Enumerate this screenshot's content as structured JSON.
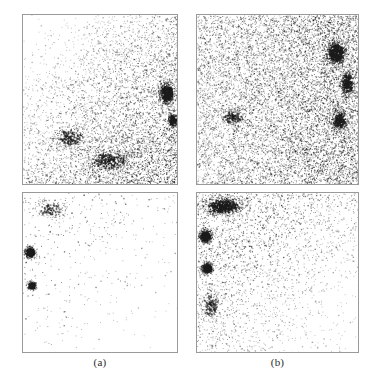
{
  "figure": {
    "background_color": "#ffffff",
    "border_color": "#9a9a9a",
    "point_color": "#1b1b1b",
    "width": 382,
    "height": 389
  },
  "captions": {
    "a": "(a)",
    "b": "(b)"
  },
  "chart_data": [
    {
      "id": "panel-a-top",
      "type": "scatter",
      "title": "",
      "xlabel": "",
      "ylabel": "",
      "xlim": [
        0,
        1
      ],
      "ylim": [
        0,
        1
      ],
      "grid": false,
      "legend": null,
      "n_points": 5200,
      "point_color": "#1b1b1b",
      "point_size_px": 1,
      "density_model": "diagonal-gradient",
      "description": "Sparse in upper-left corner, density increases smoothly toward the lower-right; a dense dark cluster sits at the right edge near mid-height.",
      "density_field": {
        "base": 0.18,
        "gradient_axis": "upper-left-to-lower-right",
        "gradient_strength": 0.95
      },
      "clusters": [
        {
          "cx": 0.93,
          "cy": 0.46,
          "rx": 0.085,
          "ry": 0.1,
          "weight": 420,
          "darkness": 0.95
        },
        {
          "cx": 0.97,
          "cy": 0.62,
          "rx": 0.05,
          "ry": 0.07,
          "weight": 180,
          "darkness": 0.9
        },
        {
          "cx": 0.55,
          "cy": 0.86,
          "rx": 0.22,
          "ry": 0.1,
          "weight": 300,
          "darkness": 0.7
        },
        {
          "cx": 0.3,
          "cy": 0.72,
          "rx": 0.16,
          "ry": 0.1,
          "weight": 200,
          "darkness": 0.6
        }
      ]
    },
    {
      "id": "panel-b-top",
      "type": "scatter",
      "title": "",
      "xlabel": "",
      "ylabel": "",
      "xlim": [
        0,
        1
      ],
      "ylim": [
        0,
        1
      ],
      "grid": false,
      "legend": null,
      "n_points": 9400,
      "point_color": "#1b1b1b",
      "point_size_px": 1,
      "density_model": "near-uniform-dense",
      "description": "Uniformly dense speckle over the whole square with a pronounced dark cluster at the upper-right and a second darker band down the right side.",
      "density_field": {
        "base": 0.72,
        "gradient_axis": "left-to-right",
        "gradient_strength": 0.3
      },
      "clusters": [
        {
          "cx": 0.86,
          "cy": 0.22,
          "rx": 0.1,
          "ry": 0.11,
          "weight": 520,
          "darkness": 0.95
        },
        {
          "cx": 0.93,
          "cy": 0.4,
          "rx": 0.07,
          "ry": 0.12,
          "weight": 300,
          "darkness": 0.85
        },
        {
          "cx": 0.88,
          "cy": 0.62,
          "rx": 0.09,
          "ry": 0.1,
          "weight": 260,
          "darkness": 0.8
        },
        {
          "cx": 0.22,
          "cy": 0.6,
          "rx": 0.12,
          "ry": 0.08,
          "weight": 180,
          "darkness": 0.55
        }
      ]
    },
    {
      "id": "panel-a-bottom",
      "type": "scatter",
      "title": "",
      "xlabel": "",
      "ylabel": "",
      "xlim": [
        0,
        1
      ],
      "ylim": [
        0,
        1
      ],
      "grid": false,
      "legend": null,
      "n_points": 430,
      "point_color": "#1b1b1b",
      "point_size_px": 1,
      "density_model": "sparse-with-blobs",
      "description": "Mostly empty white field; scattered points concentrated along the top edge and left side, plus two compact dark blobs hugging the left border at roughly 36% and 55% of the height.",
      "density_field": {
        "base": 0.05,
        "gradient_axis": "lower-right-to-upper-left",
        "gradient_strength": 0.85
      },
      "clusters": [
        {
          "cx": 0.045,
          "cy": 0.37,
          "rx": 0.055,
          "ry": 0.055,
          "weight": 330,
          "darkness": 1.0
        },
        {
          "cx": 0.055,
          "cy": 0.58,
          "rx": 0.045,
          "ry": 0.045,
          "weight": 200,
          "darkness": 0.85
        },
        {
          "cx": 0.18,
          "cy": 0.1,
          "rx": 0.16,
          "ry": 0.09,
          "weight": 140,
          "darkness": 0.45
        }
      ]
    },
    {
      "id": "panel-b-bottom",
      "type": "scatter",
      "title": "",
      "xlabel": "",
      "ylabel": "",
      "xlim": [
        0,
        1
      ],
      "ylim": [
        0,
        1
      ],
      "grid": false,
      "legend": null,
      "n_points": 2600,
      "point_color": "#1b1b1b",
      "point_size_px": 1,
      "density_model": "top-left-band-with-blobs",
      "description": "A dense dark band sweeps across the upper-left and fades to the right; two solid dark blobs sit on the left border near 27% and 47% height; the lower half keeps a faint grey speckle that thins toward the lower-right.",
      "density_field": {
        "base": 0.22,
        "gradient_axis": "lower-right-to-upper-left",
        "gradient_strength": 0.8
      },
      "clusters": [
        {
          "cx": 0.05,
          "cy": 0.27,
          "rx": 0.06,
          "ry": 0.06,
          "weight": 470,
          "darkness": 1.0
        },
        {
          "cx": 0.06,
          "cy": 0.47,
          "rx": 0.055,
          "ry": 0.055,
          "weight": 360,
          "darkness": 0.95
        },
        {
          "cx": 0.16,
          "cy": 0.08,
          "rx": 0.2,
          "ry": 0.09,
          "weight": 560,
          "darkness": 0.8
        },
        {
          "cx": 0.08,
          "cy": 0.7,
          "rx": 0.09,
          "ry": 0.14,
          "weight": 170,
          "darkness": 0.5
        }
      ]
    }
  ]
}
